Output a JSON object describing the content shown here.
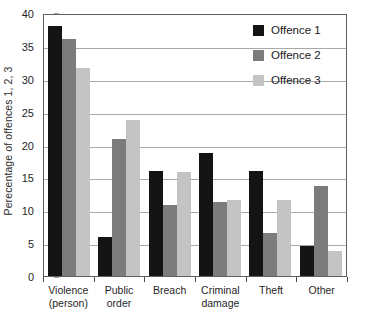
{
  "chart_data": {
    "type": "bar",
    "title": "",
    "subtitle": "",
    "xlabel": "",
    "ylabel": "Perecentage of offences 1, 2, 3",
    "ylim": [
      0,
      40
    ],
    "ytick_step": 5,
    "yticks": [
      0,
      5,
      10,
      15,
      20,
      25,
      30,
      35,
      40
    ],
    "ytick_labels": [
      "0",
      "5",
      "10",
      "15",
      "20",
      "25",
      "30",
      "35",
      "40"
    ],
    "grid": true,
    "grid_axis": "y",
    "legend_position": "top-right",
    "categories": [
      "Violence (person)",
      "Public order",
      "Breach",
      "Criminal damage",
      "Theft",
      "Other"
    ],
    "category_lines": [
      [
        "Violence",
        "(person)"
      ],
      [
        "Public",
        "order"
      ],
      [
        "Breach",
        ""
      ],
      [
        "Criminal",
        "damage"
      ],
      [
        "Theft",
        ""
      ],
      [
        "Other",
        ""
      ]
    ],
    "series": [
      {
        "name": "Offence 1",
        "color": "#141414",
        "values": [
          38.0,
          5.9,
          16.0,
          18.7,
          15.9,
          4.6
        ]
      },
      {
        "name": "Offence 2",
        "color": "#7c7c7c",
        "values": [
          36.0,
          20.9,
          10.8,
          11.2,
          6.5,
          13.7
        ]
      },
      {
        "name": "Offence 3",
        "color": "#c4c4c4",
        "values": [
          31.6,
          23.8,
          15.8,
          11.6,
          11.5,
          3.8
        ]
      }
    ]
  },
  "legend": {
    "items": [
      {
        "label": "Offence 1",
        "color": "#141414"
      },
      {
        "label": "Offence 2",
        "color": "#7c7c7c"
      },
      {
        "label": "Offence 3",
        "color": "#c4c4c4"
      }
    ]
  },
  "colors": {
    "series_1": "#141414",
    "series_2": "#7c7c7c",
    "series_3": "#c4c4c4",
    "gridline": "#a9a9a9",
    "axis": "#5e5e5e",
    "text": "#1f1f1f",
    "background": "#ffffff"
  }
}
